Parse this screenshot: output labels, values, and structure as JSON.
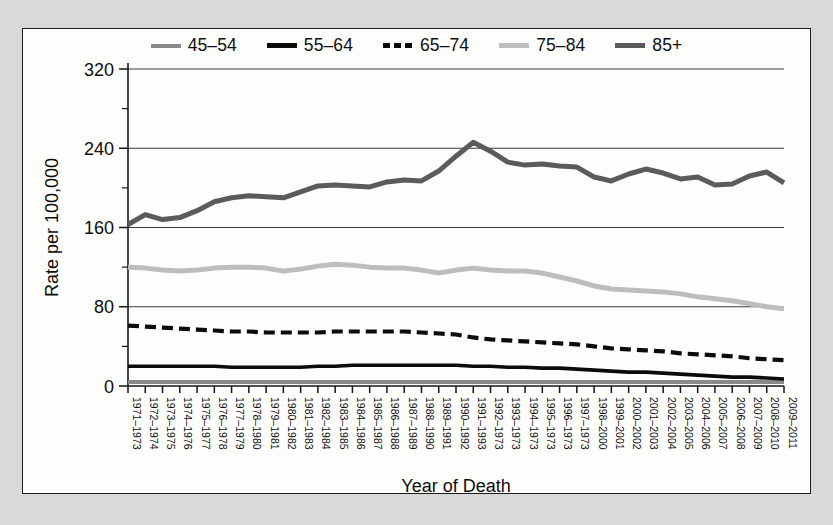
{
  "figure": {
    "background_color": "#fdfdfb",
    "border_color": "#1b1b1b",
    "page_background": "#d9d9d7"
  },
  "legend": {
    "position": "top-center",
    "entries": [
      {
        "label": "45–54",
        "color": "#8a8a8a",
        "style": "solid",
        "swatch_name": "legend-swatch-45-54"
      },
      {
        "label": "55–64",
        "color": "#0b0b0b",
        "style": "solid",
        "swatch_name": "legend-swatch-55-64"
      },
      {
        "label": "65–74",
        "color": "#0b0b0b",
        "style": "dashed",
        "swatch_name": "legend-swatch-65-74"
      },
      {
        "label": "75–84",
        "color": "#bdbdbd",
        "style": "solid",
        "swatch_name": "legend-swatch-75-84"
      },
      {
        "label": "85+",
        "color": "#5b5b5b",
        "style": "solid",
        "swatch_name": "legend-swatch-85-plus"
      }
    ]
  },
  "chart_data": {
    "type": "line",
    "title": "",
    "xlabel": "Year of Death",
    "ylabel": "Rate per 100,000",
    "ylim": [
      0,
      320
    ],
    "yticks": [
      0,
      80,
      160,
      240,
      320
    ],
    "yticks_minor": [
      40,
      120,
      200,
      280
    ],
    "ytick_labels": [
      "0",
      "80",
      "160",
      "240",
      "320"
    ],
    "grid": "horizontal-major",
    "legend_position": "top-center",
    "categories": [
      "1971–1973",
      "1972–1974",
      "1973–1975",
      "1974–1976",
      "1975–1977",
      "1976–1978",
      "1977–1979",
      "1978–1980",
      "1979–1981",
      "1980–1982",
      "1981–1983",
      "1982–1984",
      "1983–1985",
      "1984–1986",
      "1985–1987",
      "1986–1988",
      "1987–1989",
      "1988–1990",
      "1989–1991",
      "1990–1992",
      "1991–1993",
      "1992–1973",
      "1993–1973",
      "1994–1973",
      "1995–1973",
      "1996–1973",
      "1997–1973",
      "1998–2000",
      "1999–2001",
      "2000–2002",
      "2001–2003",
      "2002–2004",
      "2003–2005",
      "2004–2006",
      "2005–2007",
      "2006–2008",
      "2007–2009",
      "2008–2010",
      "2009–2011"
    ],
    "series": [
      {
        "name": "45–54",
        "color": "#8a8a8a",
        "style": "solid",
        "width": 4,
        "values": [
          4,
          4,
          4,
          4,
          4,
          4,
          4,
          4,
          4,
          4,
          4,
          4,
          4,
          4,
          4,
          4,
          4,
          4,
          4,
          4,
          4,
          4,
          4,
          4,
          4,
          4,
          4,
          4,
          4,
          4,
          4,
          4,
          4,
          4,
          4,
          4,
          4,
          4,
          4
        ]
      },
      {
        "name": "55–64",
        "color": "#0b0b0b",
        "style": "solid",
        "width": 3.6,
        "values": [
          20,
          20,
          20,
          20,
          20,
          20,
          19,
          19,
          19,
          19,
          19,
          20,
          20,
          21,
          21,
          21,
          21,
          21,
          21,
          21,
          20,
          20,
          19,
          19,
          18,
          18,
          17,
          16,
          15,
          14,
          14,
          13,
          12,
          11,
          10,
          9,
          9,
          8,
          7
        ]
      },
      {
        "name": "65–74",
        "color": "#0b0b0b",
        "style": "dashed",
        "width": 4.2,
        "values": [
          61,
          60,
          59,
          58,
          57,
          56,
          55,
          55,
          54,
          54,
          54,
          54,
          55,
          55,
          55,
          55,
          55,
          54,
          53,
          52,
          49,
          47,
          46,
          45,
          44,
          43,
          42,
          40,
          38,
          37,
          36,
          35,
          33,
          32,
          31,
          30,
          28,
          27,
          26
        ]
      },
      {
        "name": "75–84",
        "color": "#bdbdbd",
        "style": "solid",
        "width": 5,
        "values": [
          120,
          119,
          117,
          116,
          117,
          119,
          120,
          120,
          119,
          116,
          118,
          121,
          123,
          122,
          120,
          119,
          119,
          117,
          114,
          117,
          119,
          117,
          116,
          116,
          114,
          110,
          106,
          101,
          98,
          97,
          96,
          95,
          93,
          90,
          88,
          86,
          83,
          80,
          78
        ]
      },
      {
        "name": "85+",
        "color": "#5b5b5b",
        "style": "solid",
        "width": 5,
        "values": [
          163,
          173,
          168,
          170,
          177,
          186,
          190,
          192,
          191,
          190,
          196,
          202,
          203,
          202,
          201,
          206,
          208,
          207,
          217,
          232,
          246,
          237,
          226,
          223,
          224,
          222,
          221,
          211,
          207,
          214,
          219,
          215,
          209,
          211,
          203,
          204,
          212,
          216,
          205
        ]
      }
    ]
  },
  "axes": {
    "x_title": "Year of Death",
    "y_title": "Rate per 100,000"
  }
}
